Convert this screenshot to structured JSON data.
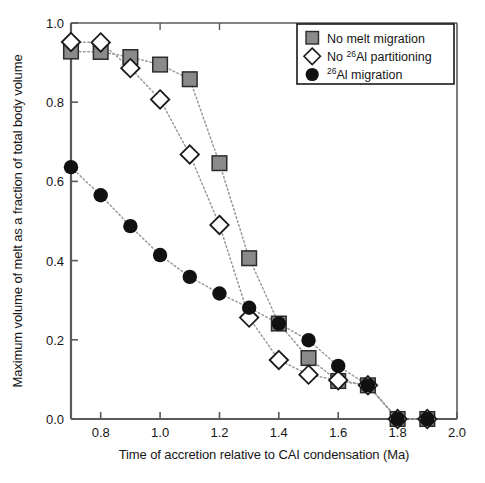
{
  "chart_data": {
    "type": "scatter",
    "title": "",
    "subtitle": "",
    "xlabel": "Time of accretion relative to CAI condensation (Ma)",
    "ylabel": "Maximum volume of melt as a fraction of total body volume",
    "xlim": [
      0.7,
      2.0
    ],
    "ylim": [
      0.0,
      1.0
    ],
    "xticks": [
      0.8,
      1.0,
      1.2,
      1.4,
      1.6,
      1.8,
      2.0
    ],
    "xtick_labels": [
      "0.8",
      "1.0",
      "1.2",
      "1.4",
      "1.6",
      "1.8",
      "2.0"
    ],
    "yticks": [
      0.0,
      0.2,
      0.4,
      0.6,
      0.8,
      1.0
    ],
    "ytick_labels": [
      "0.0",
      "0.2",
      "0.4",
      "0.6",
      "0.8",
      "1.0"
    ],
    "grid": false,
    "legend_position": "top-right",
    "connector_style": "dotted",
    "series": [
      {
        "name": "No melt migration",
        "marker": "square",
        "marker_fill": "#8a8a8a",
        "marker_edge": "#2b2b2b",
        "x": [
          0.7,
          0.8,
          0.9,
          1.0,
          1.1,
          1.2,
          1.3,
          1.4,
          1.5,
          1.6,
          1.7,
          1.8,
          1.9
        ],
        "values": [
          0.928,
          0.927,
          0.914,
          0.895,
          0.858,
          0.646,
          0.406,
          0.241,
          0.154,
          0.096,
          0.085,
          0.0,
          0.0
        ]
      },
      {
        "name": "No 26Al partitioning",
        "marker": "diamond",
        "marker_fill": "#ffffff",
        "marker_edge": "#1a1a1a",
        "x": [
          0.7,
          0.8,
          0.9,
          1.0,
          1.1,
          1.2,
          1.3,
          1.4,
          1.5,
          1.6,
          1.7,
          1.8,
          1.9
        ],
        "values": [
          0.952,
          0.951,
          0.886,
          0.807,
          0.668,
          0.49,
          0.256,
          0.149,
          0.112,
          0.098,
          0.085,
          0.0,
          0.0
        ]
      },
      {
        "name": "26Al migration",
        "marker": "circle",
        "marker_fill": "#111111",
        "marker_edge": "#111111",
        "x": [
          0.7,
          0.8,
          0.9,
          1.0,
          1.1,
          1.2,
          1.3,
          1.4,
          1.5,
          1.6,
          1.7,
          1.8,
          1.9
        ],
        "values": [
          0.636,
          0.565,
          0.487,
          0.414,
          0.359,
          0.317,
          0.281,
          0.241,
          0.199,
          0.134,
          0.085,
          0.0,
          0.0
        ]
      }
    ],
    "legend": [
      {
        "label_prefix": "No melt migration",
        "sup": "",
        "label_suffix": "",
        "marker": "square"
      },
      {
        "label_prefix": "No ",
        "sup": "26",
        "label_suffix": "Al partitioning",
        "marker": "diamond"
      },
      {
        "label_prefix": "",
        "sup": "26",
        "label_suffix": "Al migration",
        "marker": "circle"
      }
    ]
  },
  "axes": {
    "x_title": "Time of accretion relative to CAI condensation (Ma)",
    "y_title": "Maximum volume of melt as a fraction of total body volume",
    "x_tick_0": "0.8",
    "x_tick_1": "1.0",
    "x_tick_2": "1.2",
    "x_tick_3": "1.4",
    "x_tick_4": "1.6",
    "x_tick_5": "1.8",
    "x_tick_6": "2.0",
    "y_tick_0": "0.0",
    "y_tick_1": "0.2",
    "y_tick_2": "0.4",
    "y_tick_3": "0.6",
    "y_tick_4": "0.8",
    "y_tick_5": "1.0"
  },
  "legend": {
    "item_0_text": "No melt migration",
    "item_1_pre": "No ",
    "item_1_sup": "26",
    "item_1_post": "Al partitioning",
    "item_2_sup": "26",
    "item_2_post": "Al migration"
  },
  "colors": {
    "square_fill": "#8a8a8a",
    "square_edge": "#2b2b2b",
    "diamond_fill": "#ffffff",
    "diamond_edge": "#1a1a1a",
    "circle_fill": "#111111",
    "axis": "#5a5a5a",
    "connector": "#9a9a9a"
  }
}
